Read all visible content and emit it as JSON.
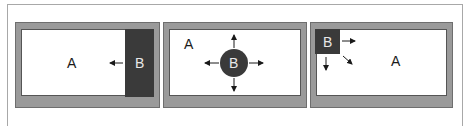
{
  "colors": {
    "panel_gray": "#9a9a9a",
    "dark_block": "#3a3a3a",
    "white": "#ffffff",
    "text": "#1a1a1a"
  },
  "panels": [
    {
      "id": "panel-1",
      "region_a_label": "A",
      "region_b_label": "B",
      "description": "B is a dark side region at right edge; arrow points left from B into A"
    },
    {
      "id": "panel-2",
      "region_a_label": "A",
      "region_b_label": "B",
      "description": "B is a dark circle in center of A with arrows pointing up, down, left, right"
    },
    {
      "id": "panel-3",
      "region_a_label": "A",
      "region_b_label": "B",
      "description": "B is a dark square in top-left corner of A with arrows pointing right, down, and diagonally down-right"
    }
  ]
}
